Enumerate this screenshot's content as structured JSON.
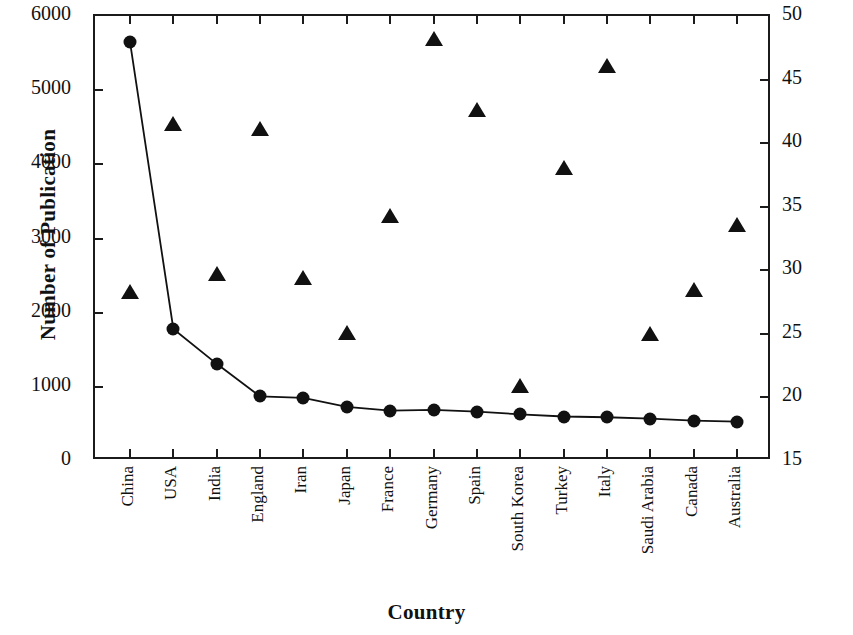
{
  "chart_data": {
    "type": "line",
    "title": "",
    "xlabel": "Country",
    "ylabel": "Number of Publication",
    "y2label": "Average Citation per Publication",
    "categories": [
      "China",
      "USA",
      "India",
      "England",
      "Iran",
      "Japan",
      "France",
      "Germany",
      "Spain",
      "South Korea",
      "Turkey",
      "Italy",
      "Saudi Arabia",
      "Canada",
      "Australia"
    ],
    "ylim": [
      0,
      6000
    ],
    "yticks": [
      0,
      1000,
      2000,
      3000,
      4000,
      5000,
      6000
    ],
    "y2lim": [
      15,
      50
    ],
    "y2ticks": [
      15,
      20,
      25,
      30,
      35,
      40,
      45,
      50
    ],
    "grid": false,
    "legend": "none",
    "series": [
      {
        "name": "Number of Publication",
        "axis": "left",
        "marker": "circle",
        "line": true,
        "values": [
          5650,
          1780,
          1310,
          870,
          850,
          730,
          680,
          690,
          665,
          630,
          600,
          590,
          570,
          545,
          530
        ]
      },
      {
        "name": "Average Citation per Publication",
        "axis": "right",
        "marker": "triangle",
        "line": false,
        "values": [
          28.2,
          41.4,
          29.6,
          41.0,
          29.3,
          25.0,
          34.2,
          48.1,
          42.5,
          20.8,
          38.0,
          46.0,
          24.9,
          28.4,
          33.5
        ]
      }
    ]
  },
  "axis": {
    "left_labels": [
      "6000",
      "5000",
      "4000",
      "3000",
      "2000",
      "1000",
      "0"
    ],
    "right_labels": [
      "50",
      "45",
      "40",
      "35",
      "30",
      "25",
      "20",
      "15"
    ],
    "x_title": "Country",
    "y_title_left": "Number of Publication",
    "y_title_right": "Average Citation per Publication"
  }
}
